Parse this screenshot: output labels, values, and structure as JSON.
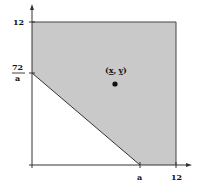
{
  "diagram": {
    "axes": {
      "y_tick_top": "12",
      "y_tick_frac_num": "72",
      "y_tick_frac_den": "a",
      "x_tick_a": "a",
      "x_tick_right": "12"
    },
    "point": {
      "label_open": "(",
      "label_x": "x",
      "label_comma": ",",
      "label_y": "y",
      "label_close": ")"
    },
    "colors": {
      "region_fill": "#c9c9c9",
      "axis": "#333333"
    }
  }
}
